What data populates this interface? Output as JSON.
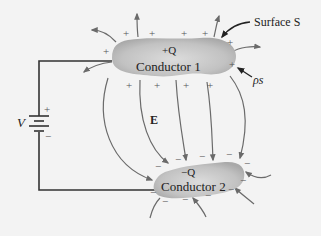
{
  "diagram": {
    "conductor1": {
      "label": "Conductor 1",
      "charge": "+Q"
    },
    "conductor2": {
      "label": "Conductor 2",
      "charge": "−Q"
    },
    "surface_label": "Surface S",
    "surface_charge_label": "ρs",
    "field_label": "E",
    "voltage_label": "V",
    "battery": {
      "plus": "+",
      "minus": "−"
    },
    "colors": {
      "background": "#f3f3f3",
      "conductor_fill": "#c4c4c4",
      "field_lines": "#6a6a6a",
      "wire": "#333333",
      "text": "#222222"
    }
  }
}
